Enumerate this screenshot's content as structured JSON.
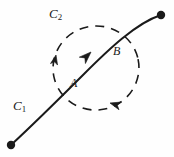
{
  "figure": {
    "background_color": "#fefefe",
    "ink_color": "#1a1a1a",
    "width": 174,
    "height": 157,
    "labels": {
      "c1": {
        "base": "C",
        "sub": "1",
        "x": 13,
        "y": 99
      },
      "c2": {
        "base": "C",
        "sub": "2",
        "x": 49,
        "y": 7
      },
      "a": {
        "text": "A",
        "x": 70,
        "y": 77
      },
      "b": {
        "text": "B",
        "x": 113,
        "y": 45
      }
    },
    "curves": [
      {
        "name": "c1-open-curve",
        "style": "solid",
        "stroke_width": 2.0,
        "path": "M 11,145 C 40,118 62,96 86,72 C 110,48 136,24 161,15",
        "endpoints": [
          {
            "name": "start-dot",
            "x": 11,
            "y": 145,
            "r": 4.2
          },
          {
            "name": "end-dot",
            "x": 161,
            "y": 15,
            "r": 4.2
          }
        ],
        "arrow": {
          "x": 88,
          "y": 55,
          "angle": -46
        }
      },
      {
        "name": "c2-dashed-circle",
        "style": "dashed",
        "stroke_width": 1.6,
        "dash_pattern": "9 7",
        "center_x": 96,
        "center_y": 68,
        "radius_x": 43,
        "radius_y": 42,
        "rotation": -12,
        "arrows": [
          {
            "name": "c2-arrow-left",
            "x": 55,
            "y": 58,
            "angle": -78
          },
          {
            "name": "c2-arrow-bottom",
            "x": 119,
            "y": 101,
            "angle": 205
          }
        ]
      }
    ],
    "intersection_points": [
      {
        "name": "point-a",
        "x": 67,
        "y": 88
      },
      {
        "name": "point-b",
        "x": 124,
        "y": 37
      }
    ]
  }
}
